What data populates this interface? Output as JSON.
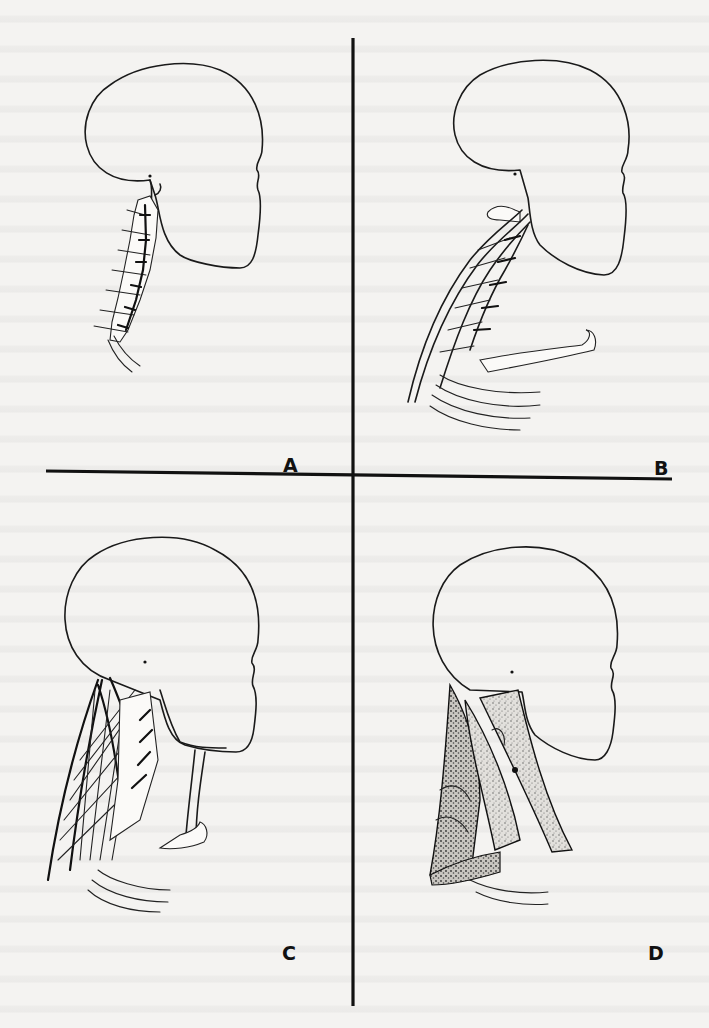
{
  "figure": {
    "panels": [
      {
        "id": "A",
        "label": "A",
        "description": "Lateral head profile with cervical spine and vertebrae"
      },
      {
        "id": "B",
        "label": "B",
        "description": "Lateral head profile with cervical spine, deep neck structures and clavicle"
      },
      {
        "id": "C",
        "label": "C",
        "description": "Lateral head profile with criss-crossing neck muscles and clavicle"
      },
      {
        "id": "D",
        "label": "D",
        "description": "Lateral head profile with stippled superficial neck muscle layers"
      }
    ],
    "layout": "2x2 quadrants separated by cross-shaped divider lines",
    "colors": {
      "ink": "#111111",
      "paper": "#f4f3f1"
    }
  }
}
